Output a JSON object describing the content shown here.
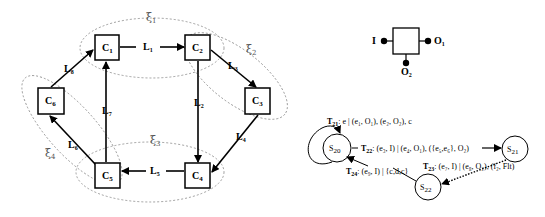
{
  "left_diagram": {
    "components": [
      {
        "id": "C1",
        "label": "C",
        "sub": "1"
      },
      {
        "id": "C2",
        "label": "C",
        "sub": "2"
      },
      {
        "id": "C3",
        "label": "C",
        "sub": "3"
      },
      {
        "id": "C4",
        "label": "C",
        "sub": "4"
      },
      {
        "id": "C5",
        "label": "C",
        "sub": "5"
      },
      {
        "id": "C6",
        "label": "C",
        "sub": "6"
      }
    ],
    "links": [
      {
        "id": "L1",
        "label": "L",
        "sub": "1",
        "from": "C1",
        "to": "C2"
      },
      {
        "id": "L2",
        "label": "L",
        "sub": "2",
        "from": "C2",
        "to": "C4"
      },
      {
        "id": "L3",
        "label": "L",
        "sub": "3",
        "from": "C2",
        "to": "C3"
      },
      {
        "id": "L4",
        "label": "L",
        "sub": "4",
        "from": "C3",
        "to": "C4"
      },
      {
        "id": "L5",
        "label": "L",
        "sub": "5",
        "from": "C4",
        "to": "C5"
      },
      {
        "id": "L6",
        "label": "L",
        "sub": "6",
        "from": "C5",
        "to": "C6"
      },
      {
        "id": "L7",
        "label": "L",
        "sub": "7",
        "from": "C5",
        "to": "C1"
      },
      {
        "id": "L8",
        "label": "L",
        "sub": "8",
        "from": "C6",
        "to": "C1"
      }
    ],
    "groups": [
      {
        "id": "xi1",
        "label": "ξ",
        "sub": "1"
      },
      {
        "id": "xi2",
        "label": "ξ",
        "sub": "2"
      },
      {
        "id": "xi3",
        "label": "ξ",
        "sub": "3"
      },
      {
        "id": "xi4",
        "label": "ξ",
        "sub": "4"
      }
    ]
  },
  "component_symbol": {
    "input": "I",
    "output1": {
      "label": "O",
      "sub": "1"
    },
    "output2": {
      "label": "O",
      "sub": "2"
    }
  },
  "automaton": {
    "states": [
      {
        "id": "S20",
        "label": "S",
        "sub": "20"
      },
      {
        "id": "S21",
        "label": "S",
        "sub": "21"
      },
      {
        "id": "S22",
        "label": "S",
        "sub": "22"
      }
    ],
    "transitions": [
      {
        "id": "T21",
        "name": "T",
        "sub": "21",
        "text": ": e | (e₁, O₁), (e₂, O₂), c"
      },
      {
        "id": "T22",
        "name": "T",
        "sub": "22",
        "text": ": (e₃, I) | (e₄, O₁), ({e₅,e₆}, O₂)"
      },
      {
        "id": "T23",
        "name": "T",
        "sub": "23",
        "text": ": (e₇, I) | (e₈, O₂), (f₂, Flt)"
      },
      {
        "id": "T24",
        "name": "T",
        "sub": "24",
        "text": ": (e₉, I) | {c,d,c}"
      }
    ]
  }
}
